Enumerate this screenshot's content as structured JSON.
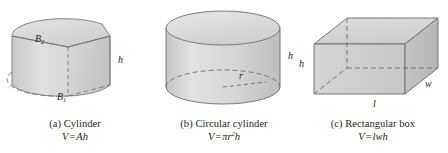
{
  "page": {
    "background_color": "#ffffff",
    "ink_color": "#231f20",
    "solid_fill_color": "#d6d6d6",
    "solid_fill_light": "#e4e4e4",
    "solid_fill_dark": "#c4c4c4",
    "outline_color": "#58595b"
  },
  "figures": [
    {
      "id": "figure-a",
      "caption_title": "(a) Cylinder",
      "formula": {
        "lhs": "V",
        "equals": "=",
        "rhs": "Ah"
      },
      "shape": "general-cylinder-sector",
      "labels": [
        {
          "name": "top-base-label",
          "text": "B",
          "sub": "2"
        },
        {
          "name": "bottom-base-label",
          "text": "B",
          "sub": "1"
        },
        {
          "name": "height-label",
          "text": "h",
          "sub": ""
        }
      ]
    },
    {
      "id": "figure-b",
      "caption_title": "(b) Circular cylinder",
      "formula": {
        "lhs": "V",
        "equals": "=",
        "rhs_pi": "π",
        "rhs_r": "r",
        "rhs_exp": "2",
        "rhs_h": "h"
      },
      "shape": "circular-cylinder",
      "labels": [
        {
          "name": "radius-label",
          "text": "r",
          "sub": ""
        },
        {
          "name": "height-label",
          "text": "h",
          "sub": ""
        }
      ]
    },
    {
      "id": "figure-c",
      "caption_title": "(c) Rectangular box",
      "formula": {
        "lhs": "V",
        "equals": "=",
        "rhs": "lwh"
      },
      "shape": "rectangular-box",
      "labels": [
        {
          "name": "height-label",
          "text": "h",
          "sub": ""
        },
        {
          "name": "length-label",
          "text": "l",
          "sub": ""
        },
        {
          "name": "width-label",
          "text": "w",
          "sub": ""
        }
      ]
    }
  ]
}
